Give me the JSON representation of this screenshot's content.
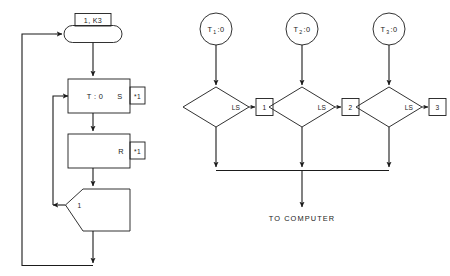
{
  "diagram": {
    "title": "",
    "background_color": "#ffffff",
    "line_color": "#1b1b1b",
    "text_color": "#1b1b1b",
    "left_chart": {
      "name": "ladder-logic-rung-sequence",
      "nodes": [
        {
          "id": "preset-tag",
          "shape": "rectangle",
          "label": "1, K3"
        },
        {
          "id": "start-terminal",
          "shape": "stadium",
          "label": ""
        },
        {
          "id": "timer-block",
          "shape": "rectangle",
          "label": "T : 0",
          "right_label": "S"
        },
        {
          "id": "timer-ref",
          "shape": "rectangle-small",
          "label": "*1"
        },
        {
          "id": "reset-block",
          "shape": "rectangle",
          "label": "",
          "right_label": "R"
        },
        {
          "id": "reset-ref",
          "shape": "rectangle-small",
          "label": "*1"
        },
        {
          "id": "compare-block",
          "shape": "pointed-left-box",
          "label": "1"
        }
      ],
      "loops": [
        {
          "id": "outer-feedback-loop",
          "from": "compare-block",
          "to": "start-terminal"
        },
        {
          "id": "inner-feedback-loop",
          "from": "compare-block",
          "to": "timer-block"
        }
      ]
    },
    "right_chart": {
      "name": "limit-switch-scan-network",
      "branches": [
        {
          "id": "branch-1",
          "circle_label": "T",
          "circle_sub": "1",
          "circle_suffix": ":0",
          "diamond_label": "LS",
          "box_label": "1"
        },
        {
          "id": "branch-2",
          "circle_label": "T",
          "circle_sub": "2",
          "circle_suffix": ":0",
          "diamond_label": "LS",
          "box_label": "2"
        },
        {
          "id": "branch-3",
          "circle_label": "T",
          "circle_sub": "3",
          "circle_suffix": ":0",
          "diamond_label": "LS",
          "box_label": "3"
        }
      ],
      "output_label": "TO COMPUTER"
    }
  }
}
